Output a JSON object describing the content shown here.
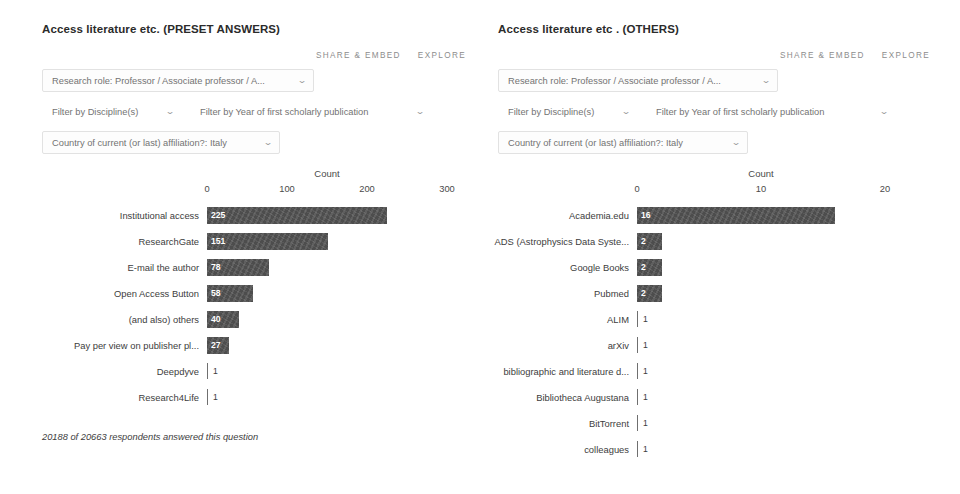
{
  "panels": [
    {
      "title": "Access literature etc. (PRESET ANSWERS)",
      "actions": {
        "share": "SHARE & EMBED",
        "explore": "EXPLORE"
      },
      "filters": {
        "role": "Research role: Professor / Associate professor / A...",
        "discipline": "Filter by Discipline(s)",
        "year": "Filter by Year of first scholarly publication",
        "country": "Country of current (or last) affiliation?: Italy"
      },
      "footnote": "20188 of 20663 respondents answered this question",
      "chart_data": {
        "type": "bar",
        "orientation": "horizontal",
        "title": "Count",
        "xlabel": "Count",
        "ylabel": "",
        "xlim": [
          0,
          300
        ],
        "ticks": [
          0,
          100,
          200,
          300
        ],
        "grid": false,
        "categories": [
          "Institutional access",
          "ResearchGate",
          "E-mail the author",
          "Open Access Button",
          "(and also) others",
          "Pay per view on publisher pl...",
          "Deepdyve",
          "Research4Life"
        ],
        "values": [
          225,
          151,
          78,
          58,
          40,
          27,
          1,
          1
        ]
      }
    },
    {
      "title": "Access literature etc . (OTHERS)",
      "actions": {
        "share": "SHARE & EMBED",
        "explore": "EXPLORE"
      },
      "filters": {
        "role": "Research role: Professor / Associate professor / A...",
        "discipline": "Filter by Discipline(s)",
        "year": "Filter by Year of first scholarly publication",
        "country": "Country of current (or last) affiliation?: Italy"
      },
      "footnote": "",
      "chart_data": {
        "type": "bar",
        "orientation": "horizontal",
        "title": "Count",
        "xlabel": "Count",
        "ylabel": "",
        "xlim": [
          0,
          20
        ],
        "ticks": [
          0,
          10,
          20
        ],
        "grid": false,
        "categories": [
          "Academia.edu",
          "ADS (Astrophysics Data Syste...",
          "Google Books",
          "Pubmed",
          "ALIM",
          "arXiv",
          "bibliographic and literature d...",
          "Bibliotheca Augustana",
          "BitTorrent",
          "colleagues"
        ],
        "values": [
          16,
          2,
          2,
          2,
          1,
          1,
          1,
          1,
          1,
          1
        ]
      }
    }
  ],
  "icons": {
    "caret": "⌄"
  },
  "colors": {
    "bar": "#4d4d4d",
    "text": "#3d3d3d",
    "muted": "#8d8d8d"
  }
}
